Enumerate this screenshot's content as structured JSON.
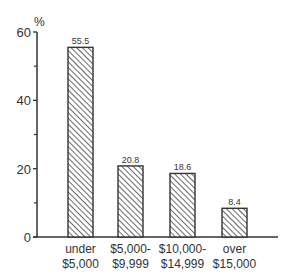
{
  "chart_data": {
    "type": "bar",
    "title": "",
    "xlabel": "",
    "ylabel": "%",
    "ylim": [
      0,
      60
    ],
    "yticks": [
      0,
      20,
      40,
      60
    ],
    "categories": [
      [
        "under",
        "$5,000"
      ],
      [
        "$5,000-",
        "$9,999"
      ],
      [
        "$10,000-",
        "$14,999"
      ],
      [
        "over",
        "$15,000"
      ]
    ],
    "values": [
      55.5,
      20.8,
      18.6,
      8.4
    ],
    "value_labels": [
      "55.5",
      "20.8",
      "18.6",
      "8.4"
    ],
    "bar_fill": "hatched",
    "grid": false,
    "legend": null
  },
  "colors": {
    "ink": "#333333",
    "background": "#ffffff"
  }
}
